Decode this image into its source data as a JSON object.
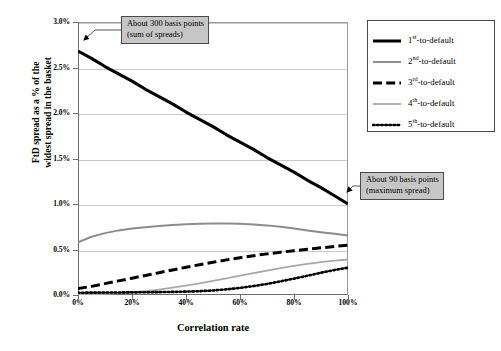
{
  "chart_data": {
    "type": "line",
    "title": "",
    "xlabel": "Correlation rate",
    "ylabel": "FtD spread as a % of the widest spread in the basket",
    "ylabel_line1": "FtD spread as a % of the",
    "ylabel_line2": "widest spread in the basket",
    "xlim": [
      0,
      100
    ],
    "ylim": [
      0,
      3.0
    ],
    "grid": true,
    "legend_position": "right",
    "xtick_labels": [
      "0%",
      "20%",
      "40%",
      "60%",
      "80%",
      "100%"
    ],
    "xtick_values": [
      0,
      20,
      40,
      60,
      80,
      100
    ],
    "ytick_labels": [
      "0.0%",
      "0.5%",
      "1.0%",
      "1.5%",
      "2.0%",
      "2.5%",
      "3.0%"
    ],
    "ytick_values": [
      0.0,
      0.5,
      1.0,
      1.5,
      2.0,
      2.5,
      3.0
    ],
    "x": [
      0,
      5,
      10,
      15,
      20,
      25,
      30,
      35,
      40,
      45,
      50,
      55,
      60,
      65,
      70,
      75,
      80,
      85,
      90,
      95,
      100
    ],
    "series": [
      {
        "name": "1st-to-default",
        "label_main": "1",
        "label_sup": "st",
        "label_tail": "-to-default",
        "style": "solid",
        "color": "#000000",
        "width": 3.0,
        "values": [
          2.68,
          2.6,
          2.51,
          2.43,
          2.35,
          2.26,
          2.18,
          2.1,
          2.01,
          1.93,
          1.85,
          1.76,
          1.68,
          1.6,
          1.51,
          1.43,
          1.35,
          1.26,
          1.18,
          1.09,
          1.0
        ]
      },
      {
        "name": "2nd-to-default",
        "label_main": "2",
        "label_sup": "nd",
        "label_tail": "-to-default",
        "style": "solid",
        "color": "#8c8c8c",
        "width": 2.0,
        "values": [
          0.58,
          0.64,
          0.68,
          0.71,
          0.73,
          0.745,
          0.757,
          0.768,
          0.777,
          0.784,
          0.787,
          0.786,
          0.782,
          0.775,
          0.765,
          0.75,
          0.731,
          0.71,
          0.69,
          0.672,
          0.655
        ]
      },
      {
        "name": "3rd-to-default",
        "label_main": "3",
        "label_sup": "rd",
        "label_tail": "-to-default",
        "style": "dashed",
        "color": "#000000",
        "width": 3.0,
        "values": [
          0.07,
          0.095,
          0.125,
          0.155,
          0.185,
          0.215,
          0.245,
          0.275,
          0.305,
          0.333,
          0.36,
          0.386,
          0.41,
          0.432,
          0.452,
          0.47,
          0.487,
          0.503,
          0.518,
          0.533,
          0.548
        ]
      },
      {
        "name": "4th-to-default",
        "label_main": "4",
        "label_sup": "th",
        "label_tail": "-to-default",
        "style": "solid",
        "color": "#a8a8a8",
        "width": 1.8,
        "values": [
          0.005,
          0.008,
          0.013,
          0.02,
          0.03,
          0.043,
          0.06,
          0.08,
          0.103,
          0.128,
          0.155,
          0.183,
          0.212,
          0.24,
          0.268,
          0.295,
          0.32,
          0.343,
          0.362,
          0.378,
          0.39
        ]
      },
      {
        "name": "5th-to-default",
        "label_main": "5",
        "label_sup": "th",
        "label_tail": "-to-default",
        "style": "dotted",
        "color": "#000000",
        "width": 2.6,
        "values": [
          0.025,
          0.026,
          0.027,
          0.028,
          0.029,
          0.03,
          0.032,
          0.034,
          0.037,
          0.042,
          0.05,
          0.062,
          0.078,
          0.098,
          0.122,
          0.15,
          0.18,
          0.212,
          0.245,
          0.275,
          0.3
        ]
      }
    ],
    "annotations": [
      {
        "id": "callout-top",
        "line1": "About 300 basis points",
        "line2": "(sum of spreads)",
        "points_to": {
          "x": 0,
          "y": 2.68
        }
      },
      {
        "id": "callout-right",
        "line1": "About 90 basis points",
        "line2": "(maximum spread)",
        "points_to": {
          "x": 100,
          "y": 1.0
        }
      }
    ]
  }
}
